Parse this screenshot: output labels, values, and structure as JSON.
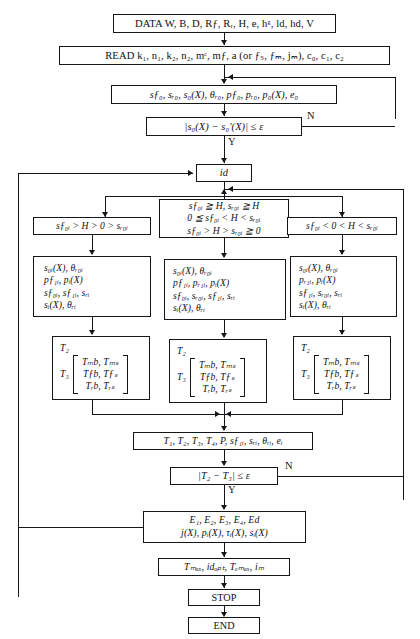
{
  "diagram": {
    "nodes": {
      "data": "DATA  W, B, D, Rƒ, Rᵣ, H, e, hᵍ, ld, hd, V",
      "read": "READ  k₁, n₁, k₂, n₂, mᶜ, mƒ, a (or ƒₛ, ƒₘ, jₘ), c₀, c₁, c₂",
      "init": "sƒ₀, sᵣ₀, s₀(X), θᵣ₀, pƒ₀, pᵣ₀, p₀(X), e₀",
      "check1": "|s₀(X) − s₀′(X)| ≤ ε",
      "loop_index": "id",
      "cond_left": "sƒ₀ᵢ > H > 0 > sᵣ₀ᵢ",
      "cond_mid_l1": "sƒ₀ᵢ ≧ H,  sᵣ₀ᵢ ≧ H",
      "cond_mid_l2": "0 ≦ sƒ₀ᵢ < H < sᵣ₀ᵢ",
      "cond_mid_l3": "sƒ₀ᵢ > H > sᵣ₀ᵢ ≧ 0",
      "cond_right": "sƒ₀ᵢ < 0 < H < sᵣ₀ᵢ",
      "proc_left": [
        "s₀ᵢ(X),  θᵣ₀ᵢ",
        "pƒ₁ᵢ,  pᵢ(X)",
        "sƒ₀ᵢ,  sƒ₁ᵢ,  sᵣᵢ",
        "sᵢ(X),  θᵣᵢ"
      ],
      "proc_mid": [
        "s₀ᵢ(X),  θᵣ₀ᵢ",
        "pƒ₁ᵢ,  pᵣ₁ᵢ,  pᵢ(X)",
        "sƒ₀ᵢ,  sᵣ₀ᵢ,  sƒ₁ᵢ,  sᵣᵢ",
        "sᵢ(X),  θᵣᵢ"
      ],
      "proc_right": [
        "s₀ᵢ(X),  θᵣ₀ᵢ",
        "pᵣ₁ᵢ,  pᵢ(X)",
        "sƒ₁ᵢ,  sᵣ₀ᵢ,  sᵣᵢ",
        "sᵢ(X),  θᵣᵢ"
      ],
      "t2_label": "T₂",
      "t3_label": "T₃",
      "matrix": [
        [
          "Tₘb,",
          "Tₘₛ"
        ],
        [
          "Tƒb,",
          "Tƒₛ"
        ],
        [
          "Tᵣb,",
          "Tᵣₛ"
        ]
      ],
      "collect": "T₁, T₂, T₃, T₄, P, sƒ₁ᵢ, sᵣᵢ, θᵣᵢ, eᵢ",
      "check2": "|T₂ − T₃| ≤ ε",
      "results_l1": "E₁, E₂, E₃, E₄, Ed",
      "results_l2": "j(X), pᵢ(X), τᵢ(X), sᵢ(X)",
      "maxima": "Tₘₐₓ, idₒₚₜ, Tₑₘₐₓ, iₘ",
      "stop": "STOP",
      "end": "END"
    },
    "branch_labels": {
      "no1": "N",
      "yes1": "Y",
      "no2": "N",
      "yes2": "Y"
    },
    "colors": {
      "stroke": "#15161a",
      "background": "#ffffff"
    }
  }
}
